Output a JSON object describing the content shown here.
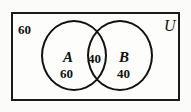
{
  "diagram": {
    "type": "venn",
    "universe": {
      "label": "U",
      "outside_count": "60",
      "border_color": "#1a1a1a",
      "background_color": "#fdfdfc"
    },
    "sets": [
      {
        "id": "A",
        "label": "A",
        "only_count": "60",
        "stroke_color": "#111111"
      },
      {
        "id": "B",
        "label": "B",
        "only_count": "40",
        "stroke_color": "#111111"
      }
    ],
    "intersection": {
      "label": "A and B",
      "count": "40"
    }
  },
  "chart_data": {
    "type": "venn",
    "sets": [
      "A",
      "B"
    ],
    "universe_label": "U",
    "regions": [
      {
        "region": "A only",
        "value": 60
      },
      {
        "region": "A and B",
        "value": 40
      },
      {
        "region": "B only",
        "value": 40
      },
      {
        "region": "outside A and B",
        "value": 60
      }
    ],
    "totals": {
      "A": 100,
      "B": 80,
      "universe": 200
    },
    "legend": "none",
    "grid": false
  }
}
